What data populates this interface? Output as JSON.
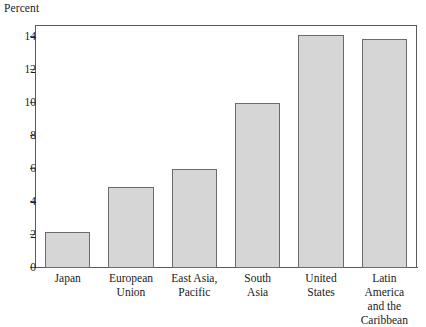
{
  "chart_data": {
    "type": "bar",
    "title": "",
    "subtitle": "",
    "xlabel": "",
    "ylabel": "Percent",
    "ylim": [
      0,
      14.6
    ],
    "yticks": [
      0,
      2,
      4,
      6,
      8,
      10,
      12,
      14
    ],
    "ytick_labels": [
      "0",
      "2",
      "4",
      "6",
      "8",
      "10",
      "12",
      "14"
    ],
    "grid": false,
    "legend": false,
    "legend_position": "none",
    "categories": [
      "Japan",
      "European Union",
      "East Asia, Pacific",
      "South Asia",
      "United States",
      "Latin America and the Caribbean"
    ],
    "category_lines": [
      [
        "Japan"
      ],
      [
        "European",
        "Union"
      ],
      [
        "East Asia,",
        "Pacific"
      ],
      [
        "South",
        "Asia"
      ],
      [
        "United",
        "States"
      ],
      [
        "Latin",
        "America",
        "and the",
        "Caribbean"
      ]
    ],
    "values": [
      2.2,
      4.9,
      6.0,
      10.0,
      14.1,
      13.9
    ],
    "bar_color": "#d6d6d6",
    "bar_edge_color": "#6b6b6b",
    "axis_color": "#5a5a5a",
    "text_color": "#1a1a1a",
    "background_color": "#ffffff"
  }
}
